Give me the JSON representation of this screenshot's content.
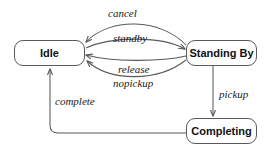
{
  "diagram": {
    "type": "state-machine-diagram",
    "title": "",
    "canvas": {
      "width": 266,
      "height": 153,
      "background": "#ffffff"
    },
    "stroke_color": "#5a5a5a",
    "text_color": "#111111",
    "states": [
      {
        "id": "idle",
        "label": "Idle",
        "x": 14,
        "y": 40,
        "w": 71,
        "h": 26
      },
      {
        "id": "standing_by",
        "label": "Standing By",
        "x": 186,
        "y": 40,
        "w": 71,
        "h": 26
      },
      {
        "id": "completing",
        "label": "Completing",
        "x": 186,
        "y": 118,
        "w": 71,
        "h": 26
      }
    ],
    "transitions": [
      {
        "id": "cancel",
        "label": "cancel",
        "from": "standing_by",
        "to": "idle",
        "label_x": 108,
        "label_y": 7
      },
      {
        "id": "standby",
        "label": "standby",
        "from": "idle",
        "to": "standing_by",
        "label_x": 113,
        "label_y": 32
      },
      {
        "id": "release",
        "label": "release",
        "from": "standing_by",
        "to": "idle",
        "label_x": 118,
        "label_y": 63
      },
      {
        "id": "nopickup",
        "label": "nopickup",
        "from": "standing_by",
        "to": "idle",
        "label_x": 113,
        "label_y": 77
      },
      {
        "id": "pickup",
        "label": "pickup",
        "from": "standing_by",
        "to": "completing",
        "label_x": 219,
        "label_y": 88
      },
      {
        "id": "complete",
        "label": "complete",
        "from": "completing",
        "to": "idle",
        "label_x": 55,
        "label_y": 95
      }
    ]
  }
}
